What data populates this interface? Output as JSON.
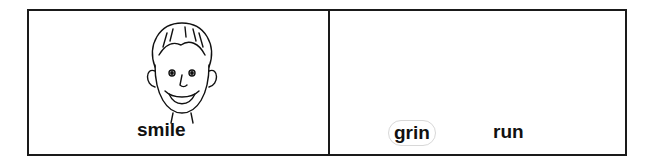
{
  "worksheet": {
    "left_panel": {
      "image": "boy-smiling-face",
      "word": "smile"
    },
    "right_panel": {
      "options": [
        {
          "word": "grin",
          "circled": true
        },
        {
          "word": "run",
          "circled": false
        }
      ]
    }
  }
}
